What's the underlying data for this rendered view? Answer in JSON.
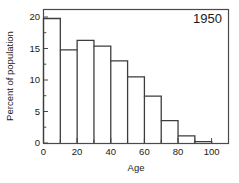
{
  "chart_data": {
    "type": "bar",
    "title": "1950",
    "xlabel": "Age",
    "ylabel": "Percent of population",
    "categories": [
      "0-10",
      "10-20",
      "20-30",
      "30-40",
      "40-50",
      "50-60",
      "60-70",
      "70-80",
      "80-90",
      "90-100"
    ],
    "bin_edges": [
      0,
      10,
      20,
      30,
      40,
      50,
      60,
      70,
      80,
      90,
      100
    ],
    "values": [
      19.4,
      14.5,
      16.0,
      15.1,
      12.8,
      10.3,
      7.3,
      3.5,
      1.1,
      0.2
    ],
    "xlim": [
      0,
      110
    ],
    "ylim": [
      0,
      20.8
    ],
    "xticks": [
      0,
      20,
      40,
      60,
      80,
      100
    ],
    "xticklabels": [
      "0",
      "20",
      "40",
      "60",
      "80",
      "100"
    ],
    "xminorticks": [
      10,
      30,
      50,
      70,
      90
    ],
    "yticks": [
      0,
      5,
      10,
      15,
      20
    ],
    "yticklabels": [
      "0",
      "5",
      "10",
      "15",
      "20"
    ],
    "grid": false,
    "legend": null,
    "bar_style": "outline-only",
    "colors": {
      "bar_stroke": "#3d3d3d",
      "axis": "#4a4a4a",
      "text": "#1a1a1a",
      "background": "#ffffff"
    },
    "title_position": "top-right-inside"
  }
}
